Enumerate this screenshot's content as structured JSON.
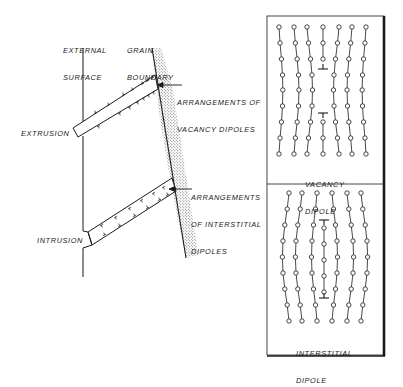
{
  "figure": {
    "type": "schematic",
    "colors": {
      "ink": "#1a1a1a",
      "stipple": "#8a8a8a",
      "background": "#ffffff"
    }
  },
  "labels": {
    "external_surface": [
      "EXTERNAL",
      "SURFACE"
    ],
    "grain_boundary": [
      "GRAIN",
      "BOUNDARY"
    ],
    "vacancy_arrangements": [
      "ARRANGEMENTS OF",
      "VACANCY DIPOLES"
    ],
    "interstitial_arrangements": [
      "ARRANGEMENTS",
      "OF INTERSTITIAL",
      "DIPOLES"
    ],
    "extrusion": "EXTRUSION",
    "intrusion": "INTRUSION"
  },
  "panels": [
    {
      "id": "vacancy",
      "caption": [
        "VACANCY",
        "DIPOLE"
      ],
      "rows": 9,
      "columns": 7,
      "defect": "vacancy dipole"
    },
    {
      "id": "interstitial",
      "caption": [
        "INTERSTITIAL",
        "DIPOLE"
      ],
      "rows": 9,
      "columns": 6,
      "defect": "interstitial dipole"
    }
  ]
}
